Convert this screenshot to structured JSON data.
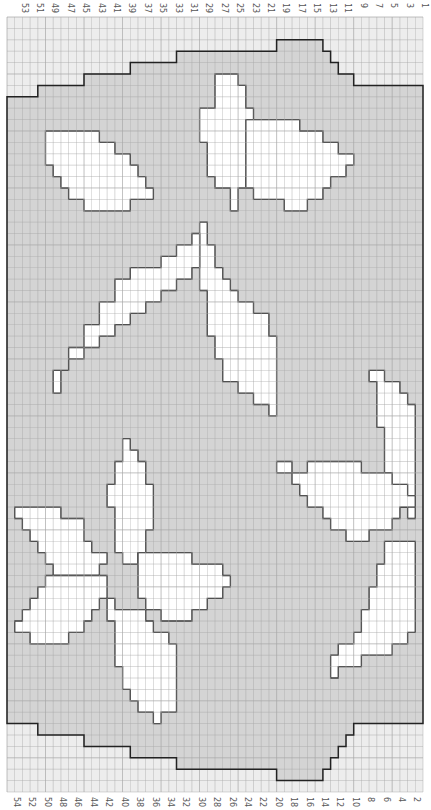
{
  "chart_data": {
    "type": "heatmap",
    "title": "",
    "columns": 54,
    "rows": 68,
    "top_labels": [
      "53",
      "51",
      "49",
      "47",
      "45",
      "43",
      "41",
      "39",
      "37",
      "35",
      "33",
      "31",
      "29",
      "27",
      "25",
      "23",
      "21",
      "19",
      "17",
      "15",
      "13",
      "11",
      "9",
      "7",
      "5",
      "3",
      "1"
    ],
    "bottom_labels": [
      "54",
      "52",
      "50",
      "48",
      "46",
      "44",
      "42",
      "40",
      "38",
      "36",
      "34",
      "32",
      "30",
      "28",
      "26",
      "24",
      "22",
      "20",
      "18",
      "16",
      "14",
      "12",
      "10",
      "8",
      "6",
      "4",
      "2"
    ],
    "legend": [
      {
        "name": "background",
        "color": "#ededed"
      },
      {
        "name": "body",
        "color": "#d6d6d6"
      },
      {
        "name": "motif",
        "color": "#ffffff"
      }
    ],
    "grid": true
  },
  "colors": {
    "background": "#ededed",
    "body": "#d4d4d4",
    "motif": "#ffffff",
    "gridline": "#a8a8a8",
    "outline": "#222222"
  }
}
